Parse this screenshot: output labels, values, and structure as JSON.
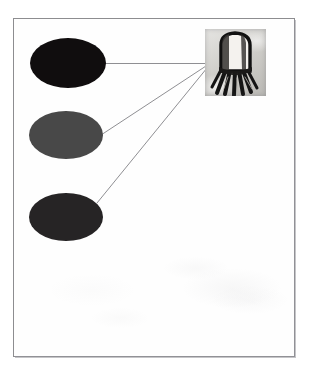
{
  "figure": {
    "type": "scanned-labelled-diagram",
    "caption_text": "",
    "canvas": {
      "width": 318,
      "height": 375,
      "background_color": "#ffffff"
    },
    "frame": {
      "name": "figure-border",
      "x": 13,
      "y": 18,
      "width": 282,
      "height": 339,
      "border_color": "#8d8d90",
      "border_width_px": 1,
      "fill_color": "#fefefe"
    },
    "blobs": [
      {
        "id": "blob-1",
        "label": "",
        "shape": "ellipse",
        "cx": 68,
        "cy": 63,
        "rx": 38,
        "ry": 25,
        "fill_color": "#100d0e",
        "tone": "near-black"
      },
      {
        "id": "blob-2",
        "label": "",
        "shape": "ellipse",
        "cx": 66,
        "cy": 135,
        "rx": 37,
        "ry": 24,
        "fill_color": "#484848",
        "tone": "medium-dark-gray"
      },
      {
        "id": "blob-3",
        "label": "",
        "shape": "ellipse",
        "cx": 66,
        "cy": 217,
        "rx": 37,
        "ry": 24,
        "fill_color": "#262425",
        "tone": "dark-charcoal"
      }
    ],
    "leader_lines": [
      {
        "id": "leader-1",
        "from_blob": "blob-1",
        "x1": 103,
        "y1": 63,
        "x2": 206,
        "y2": 63,
        "stroke_color": "#8f8f93",
        "stroke_width_px": 1,
        "style": "horizontal"
      },
      {
        "id": "leader-2",
        "from_blob": "blob-2",
        "x1": 101,
        "y1": 135,
        "x2": 206,
        "y2": 66,
        "stroke_color": "#8f8f93",
        "stroke_width_px": 1,
        "style": "diagonal"
      },
      {
        "id": "leader-3",
        "from_blob": "blob-3",
        "x1": 97,
        "y1": 203,
        "x2": 207,
        "y2": 68,
        "stroke_color": "#8f8f93",
        "stroke_width_px": 1,
        "style": "diagonal"
      }
    ],
    "photo_inset": {
      "id": "photo-inset",
      "label": "",
      "x": 205,
      "y": 29,
      "width": 61,
      "height": 67,
      "background_color": "#d8d7d3",
      "subject": "dome-topped cylindrical component with splayed dark leads",
      "body_fill_color": "#f2f0ec",
      "outline_color": "#111111",
      "lead_color": "#141414",
      "lead_count": 7
    }
  }
}
